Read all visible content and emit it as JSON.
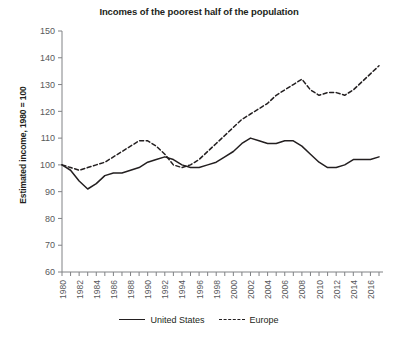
{
  "chart_data": {
    "type": "line",
    "title": "Incomes of the poorest half of the population",
    "xlabel": "",
    "ylabel": "Estimated income, 1980 = 100",
    "ylim": [
      60,
      150
    ],
    "ytick_step": 10,
    "yticks": [
      60,
      70,
      80,
      90,
      100,
      110,
      120,
      130,
      140,
      150
    ],
    "xlim": [
      1980,
      2017
    ],
    "xticks": [
      1980,
      1982,
      1984,
      1986,
      1988,
      1990,
      1992,
      1994,
      1996,
      1998,
      2000,
      2002,
      2004,
      2006,
      2008,
      2010,
      2012,
      2014,
      2016
    ],
    "xtick_labels": [
      "1980",
      "1982",
      "1984",
      "1986",
      "1988",
      "1990",
      "1992",
      "1994",
      "1996",
      "1998",
      "2000",
      "2002",
      "2004",
      "2006",
      "2008",
      "2010",
      "2012",
      "2014",
      "2016"
    ],
    "x": [
      1980,
      1981,
      1982,
      1983,
      1984,
      1985,
      1986,
      1987,
      1988,
      1989,
      1990,
      1991,
      1992,
      1993,
      1994,
      1995,
      1996,
      1997,
      1998,
      1999,
      2000,
      2001,
      2002,
      2003,
      2004,
      2005,
      2006,
      2007,
      2008,
      2009,
      2010,
      2011,
      2012,
      2013,
      2014,
      2015,
      2016,
      2017
    ],
    "grid": false,
    "legend_position": "bottom",
    "series": [
      {
        "name": "United States",
        "style": "solid",
        "color": "#231f20",
        "values": [
          100,
          98,
          94,
          91,
          93,
          96,
          97,
          97,
          98,
          99,
          101,
          102,
          103,
          102,
          100,
          99,
          99,
          100,
          101,
          103,
          105,
          108,
          110,
          109,
          108,
          108,
          109,
          109,
          107,
          104,
          101,
          99,
          99,
          100,
          102,
          102,
          102,
          103
        ]
      },
      {
        "name": "Europe",
        "style": "dashed",
        "color": "#231f20",
        "values": [
          100,
          99,
          98,
          99,
          100,
          101,
          103,
          105,
          107,
          109,
          109,
          107,
          104,
          100,
          99,
          100,
          102,
          105,
          108,
          111,
          114,
          117,
          119,
          121,
          123,
          126,
          128,
          130,
          132,
          128,
          126,
          127,
          127,
          126,
          128,
          131,
          134,
          137
        ]
      }
    ]
  },
  "legend": {
    "items": [
      {
        "label": "United States",
        "style": "solid"
      },
      {
        "label": "Europe",
        "style": "dashed"
      }
    ]
  }
}
